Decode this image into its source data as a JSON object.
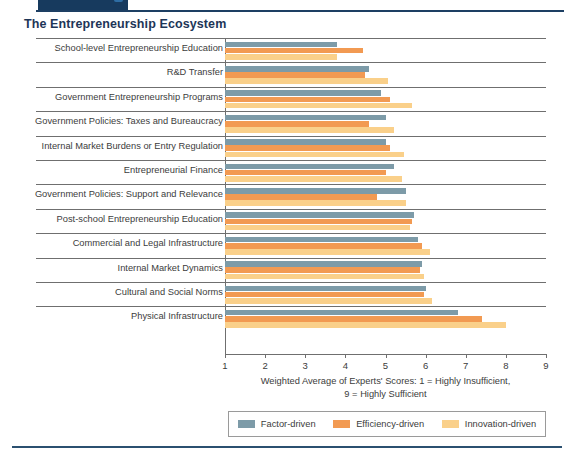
{
  "top_tab": {
    "label": "MAKING IT",
    "badge": "badge-icon"
  },
  "chart_title": "The Entrepreneurship Ecosystem",
  "legend": {
    "items": [
      {
        "label": "Factor-driven",
        "color": "#7D9BA8"
      },
      {
        "label": "Efficiency-driven",
        "color": "#F29A52"
      },
      {
        "label": "Innovation-driven",
        "color": "#FAD08A"
      }
    ]
  },
  "chart_data": {
    "type": "bar",
    "orientation": "horizontal",
    "title": "The Entrepreneurship Ecosystem",
    "xlabel": "Weighted Average of Experts' Scores: 1 = Highly Insufficient, 9 = Highly Sufficient",
    "ylabel": "",
    "xlim": [
      1,
      9
    ],
    "xticks": [
      1,
      2,
      3,
      4,
      5,
      6,
      7,
      8,
      9
    ],
    "grid": true,
    "legend_position": "bottom",
    "categories": [
      "School-level Entrepreneurship Education",
      "R&D Transfer",
      "Government Entrepreneurship Programs",
      "Government Policies: Taxes and Bureaucracy",
      "Internal Market Burdens or Entry Regulation",
      "Entrepreneurial Finance",
      "Government Policies: Support and Relevance",
      "Post-school Entrepreneurship Education",
      "Commercial and Legal Infrastructure",
      "Internal Market Dynamics",
      "Cultural and Social Norms",
      "Physical Infrastructure"
    ],
    "series": [
      {
        "name": "Factor-driven",
        "color": "#7D9BA8",
        "values": [
          3.8,
          4.6,
          4.9,
          5.0,
          5.0,
          5.2,
          5.5,
          5.7,
          5.8,
          5.9,
          6.0,
          6.8
        ]
      },
      {
        "name": "Efficiency-driven",
        "color": "#F29A52",
        "values": [
          4.45,
          4.5,
          5.1,
          4.6,
          5.1,
          5.0,
          4.8,
          5.65,
          5.9,
          5.85,
          5.95,
          7.4
        ]
      },
      {
        "name": "Innovation-driven",
        "color": "#FAD08A",
        "values": [
          3.8,
          5.05,
          5.65,
          5.2,
          5.45,
          5.4,
          5.5,
          5.6,
          6.1,
          5.95,
          6.15,
          8.0
        ]
      }
    ]
  },
  "axis_title_lines": [
    "Weighted Average of Experts' Scores: 1 = Highly Insufficient,",
    "9 = Highly Sufficient"
  ]
}
